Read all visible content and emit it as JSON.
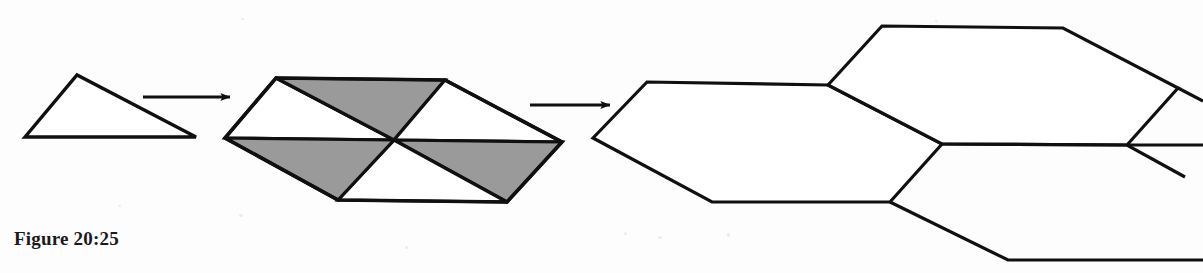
{
  "figure": {
    "caption": "Figure 20:25",
    "background_color": "#fdfdfd",
    "stroke_color": "#101010",
    "shade_color": "#9a9a9a",
    "white_fill": "#ffffff",
    "width": 1203,
    "height": 273,
    "steps": [
      {
        "name": "single-triangle",
        "label": ""
      },
      {
        "name": "six-triangle-hexagon",
        "label": ""
      },
      {
        "name": "hexagon-tiling",
        "label": ""
      }
    ],
    "arrows": [
      {
        "name": "arrow-1",
        "x1": 143,
        "y1": 97,
        "x2": 237,
        "y2": 97
      },
      {
        "name": "arrow-2",
        "x1": 530,
        "y1": 105,
        "x2": 617,
        "y2": 105
      }
    ],
    "triangle": {
      "points": "25,137 77,75 196,137",
      "fill": "#ffffff"
    },
    "hexagon_rosette": {
      "center": [
        394,
        140
      ],
      "vertices": {
        "left": [
          225,
          138
        ],
        "top_left": [
          276,
          78
        ],
        "top_right": [
          445,
          80
        ],
        "right": [
          562,
          142
        ],
        "bottom_right": [
          507,
          202
        ],
        "bottom_left": [
          338,
          200
        ]
      },
      "triangles": [
        {
          "name": "rosette-triangle-1",
          "points": "225,138 276,78 394,140",
          "shaded": false
        },
        {
          "name": "rosette-triangle-2",
          "points": "276,78 445,80 394,140",
          "shaded": true
        },
        {
          "name": "rosette-triangle-3",
          "points": "445,80 562,142 394,140",
          "shaded": false
        },
        {
          "name": "rosette-triangle-4",
          "points": "562,142 507,202 394,140",
          "shaded": true
        },
        {
          "name": "rosette-triangle-5",
          "points": "507,202 338,200 394,140",
          "shaded": false
        },
        {
          "name": "rosette-triangle-6",
          "points": "338,200 225,138 394,140",
          "shaded": true
        }
      ]
    },
    "tiling": {
      "hexagons": [
        {
          "name": "hexagon-left",
          "points": "593,138 647,82 828,85 942,144 890,202 712,202"
        },
        {
          "name": "hexagon-top-right",
          "points": "828,85 882,26 1063,28 1178,88 1127,145 942,144"
        },
        {
          "name": "hexagon-bottom-right",
          "points": "942,144 1127,145 1185,177 1203,177 1203,260 1008,260 890,202"
        }
      ],
      "open_edges": [
        {
          "name": "edge-top-right-continuation",
          "x1": 1063,
          "y1": 28,
          "x2": 1178,
          "y2": 88
        },
        {
          "name": "edge-right-continuation",
          "x1": 1127,
          "y1": 145,
          "x2": 1190,
          "y2": 179
        },
        {
          "name": "edge-bottom-continuation",
          "x1": 1008,
          "y1": 260,
          "x2": 1203,
          "y2": 260
        },
        {
          "name": "edge-bottom-right-span",
          "x1": 1127,
          "y1": 145,
          "x2": 1203,
          "y2": 145
        }
      ]
    }
  }
}
